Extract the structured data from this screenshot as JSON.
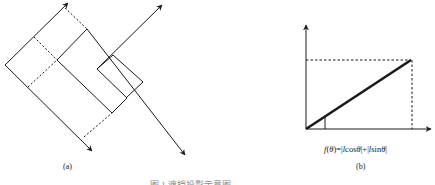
{
  "figure": {
    "panel_a": {
      "label": "(a)"
    },
    "panel_b": {
      "label": "(b)",
      "formula": {
        "f": "f",
        "theta": "θ",
        "eq": ")=|",
        "l1": "l",
        "cos": "cos",
        "mid": "|+|",
        "l2": "l",
        "sin": "sin",
        "end": "|",
        "open": "("
      }
    },
    "caption": "图 1  遮挡投影示意图"
  },
  "colors": {
    "stroke": "#1a1a1a",
    "background": "#ffffff"
  }
}
